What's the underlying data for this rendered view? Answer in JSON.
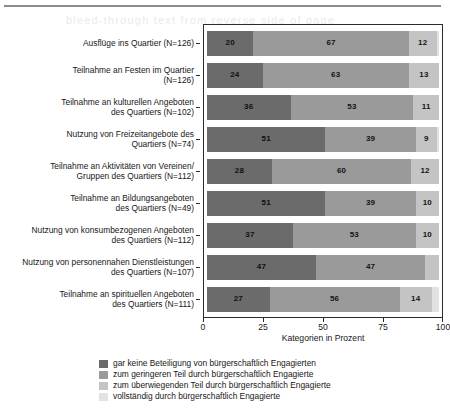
{
  "ghost_text": "bleed-through text from reverse side of page",
  "axis": {
    "x_title": "Kategorien in Prozent",
    "x_ticks": [
      "0",
      "25",
      "50",
      "75",
      "100"
    ]
  },
  "legend": {
    "items": [
      {
        "label": "gar keine Beteiligung von bürgerschaftlich Engagierten",
        "color": "#6b6b6b"
      },
      {
        "label": "zum geringeren Teil durch bürgerschaftlich Engagierte",
        "color": "#9a9a9a"
      },
      {
        "label": "zum überwiegenden Teil durch bürgerschaftlich Engagierte",
        "color": "#c4c4c4"
      },
      {
        "label": "vollständig durch bürgerschaftlich Engagierte",
        "color": "#e2e2e2"
      }
    ]
  },
  "chart_data": {
    "type": "bar",
    "orientation": "horizontal",
    "stacked": true,
    "stack_mode": "percent",
    "title": "",
    "xlabel": "Kategorien in Prozent",
    "ylabel": "",
    "xlim": [
      0,
      100
    ],
    "xticks": [
      0,
      25,
      50,
      75,
      100
    ],
    "grid": false,
    "legend_position": "bottom-left",
    "categories": [
      "Ausflüge ins Quartier (N=126)",
      "Teilnahme an Festen im Quartier (N=126)",
      "Teilnahme an kulturellen Angeboten des Quartiers (N=102)",
      "Nutzung von Freizeitangebote des Quartiers (N=74)",
      "Teilnahme an Aktivitäten von Vereinen/ Gruppen des Quartiers (N=112)",
      "Teilnahme an Bildungsangeboten des Quartiers (N=49)",
      "Nutzung von konsumbezogenen Angeboten des Quartiers (N=112)",
      "Nutzung von personennahen Dienstleistungen des Quartiers (N=107)",
      "Teilnahme an spirituellen Angeboten des Quartiers (N=111)"
    ],
    "category_lines": [
      [
        "Ausflüge ins Quartier (N=126)"
      ],
      [
        "Teilnahme an Festen im Quartier",
        "(N=126)"
      ],
      [
        "Teilnahme an kulturellen Angeboten",
        "des Quartiers (N=102)"
      ],
      [
        "Nutzung von Freizeitangebote des",
        "Quartiers (N=74)"
      ],
      [
        "Teilnahme an Aktivitäten von Vereinen/",
        "Gruppen des Quartiers (N=112)"
      ],
      [
        "Teilnahme an Bildungsangeboten",
        "des Quartiers (N=49)"
      ],
      [
        "Nutzung von konsumbezogenen Angeboten",
        "des Quartiers (N=112)"
      ],
      [
        "Nutzung von personennahen Dienstleistungen",
        "des Quartiers (N=107)"
      ],
      [
        "Teilnahme an spirituellen Angeboten",
        "des Quartiers (N=111)"
      ]
    ],
    "series": [
      {
        "name": "gar keine Beteiligung von bürgerschaftlich Engagierten",
        "color": "#6b6b6b",
        "values": [
          20,
          24,
          36,
          51,
          28,
          51,
          37,
          47,
          27
        ]
      },
      {
        "name": "zum geringeren Teil durch bürgerschaftlich Engagierte",
        "color": "#9a9a9a",
        "values": [
          67,
          63,
          53,
          39,
          60,
          39,
          53,
          47,
          56
        ]
      },
      {
        "name": "zum überwiegenden Teil durch bürgerschaftlich Engagierte",
        "color": "#c4c4c4",
        "values": [
          12,
          13,
          11,
          9,
          12,
          10,
          10,
          6,
          14
        ]
      },
      {
        "name": "vollständig durch bürgerschaftlich Engagierte",
        "color": "#e2e2e2",
        "values": [
          1,
          0,
          0,
          1,
          0,
          0,
          0,
          0,
          3
        ]
      }
    ],
    "bar_labels": [
      [
        "20",
        "67",
        "12",
        ""
      ],
      [
        "24",
        "63",
        "13",
        ""
      ],
      [
        "36",
        "53",
        "11",
        ""
      ],
      [
        "51",
        "39",
        "9",
        ""
      ],
      [
        "28",
        "60",
        "12",
        ""
      ],
      [
        "51",
        "39",
        "10",
        ""
      ],
      [
        "37",
        "53",
        "10",
        ""
      ],
      [
        "47",
        "47",
        "",
        ""
      ],
      [
        "27",
        "56",
        "14",
        ""
      ]
    ]
  }
}
